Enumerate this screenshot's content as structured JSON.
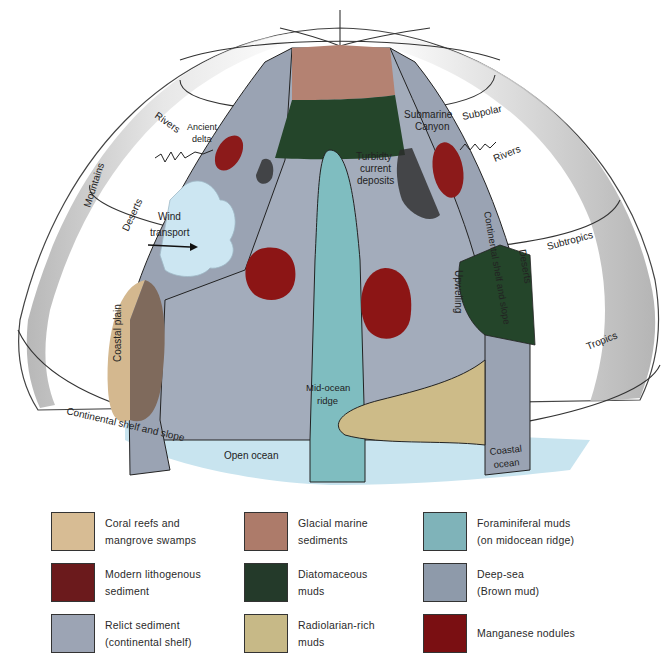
{
  "diagram": {
    "type": "globe-cutaway",
    "labels": {
      "rivers_left": "Rivers",
      "ancient_delta_1": "Ancient",
      "ancient_delta_2": "delta",
      "mountains": "Mountains",
      "deserts_left": "Deserts",
      "wind_1": "Wind",
      "wind_2": "transport",
      "coastal_plain": "Coastal plain",
      "continental_shelf": "Continental shelf and slope",
      "open_ocean": "Open  ocean",
      "mid_ocean_1": "Mid-ocean",
      "mid_ocean_2": "ridge",
      "turbidity_1": "Turbidty",
      "turbidity_2": "current",
      "turbidity_3": "deposits",
      "submarine_1": "Submarine",
      "submarine_2": "Canyon",
      "subpolar": "Subpolar",
      "rivers_right": "Rivers",
      "continental_right": "Continental shelf and slope",
      "subtropics": "Subtropics",
      "deserts_right": "Deserts",
      "upwelling": "Upwelling",
      "tropics": "Tropics",
      "coastal_ocean_1": "Coastal",
      "coastal_ocean_2": "ocean"
    },
    "colors": {
      "coral": "#d4b88f",
      "lithogenous": "#7a1c1c",
      "relict": "#9aa3b3",
      "glacial": "#b48272",
      "diatom": "#24452a",
      "radiolarian": "#cdbb88",
      "foraminiferal": "#7fbdc0",
      "deepsea": "#a3acbb",
      "manganese": "#8c1515",
      "open_ocean": "#c8e4ef",
      "cloud": "#cce6f2"
    }
  },
  "legend": {
    "items": [
      {
        "line1": "Coral reefs and",
        "line2": "mangrove swamps",
        "color": "#d7bc94"
      },
      {
        "line1": "Modern lithogenous",
        "line2": "sediment",
        "color": "#6b1a1c"
      },
      {
        "line1": "Relict sediment",
        "line2": "(continental  shelf)",
        "color": "#9ca4b4"
      },
      {
        "line1": "Glacial marine",
        "line2": "sediments",
        "color": "#ad7b6a"
      },
      {
        "line1": "Diatomaceous",
        "line2": "muds",
        "color": "#243a2a"
      },
      {
        "line1": "Radiolarian-rich",
        "line2": "muds",
        "color": "#c7b987"
      },
      {
        "line1": "Foraminiferal muds",
        "line2": "(on midocean ridge)",
        "color": "#7fb3b9"
      },
      {
        "line1": "Deep-sea",
        "line2": "(Brown mud)",
        "color": "#8e9aaa"
      },
      {
        "line1": "Manganese nodules",
        "line2": "",
        "color": "#7a0f12"
      }
    ]
  }
}
